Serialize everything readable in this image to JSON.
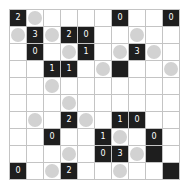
{
  "puzzle": {
    "type": "Light Up",
    "rows": 10,
    "cols": 10,
    "colors": {
      "black_cell": "#1e1e1e",
      "white_cell": "#ffffff",
      "lamp": "#d2d2d2",
      "grid_line": "#c4c4c4",
      "number": "#ffffff"
    },
    "grid": [
      [
        "2",
        "L",
        ".",
        ".",
        ".",
        ".",
        "0",
        ".",
        ".",
        "0"
      ],
      [
        "L",
        "3",
        "L",
        "2",
        "0",
        ".",
        ".",
        "L",
        ".",
        "."
      ],
      [
        ".",
        "0",
        ".",
        "L",
        "1",
        ".",
        "L",
        "3",
        "L",
        "."
      ],
      [
        ".",
        ".",
        "1",
        "1",
        ".",
        "L",
        "B",
        ".",
        ".",
        "L"
      ],
      [
        ".",
        ".",
        "L",
        ".",
        ".",
        ".",
        ".",
        ".",
        ".",
        "."
      ],
      [
        ".",
        ".",
        ".",
        "L",
        ".",
        ".",
        ".",
        ".",
        ".",
        "."
      ],
      [
        ".",
        "L",
        ".",
        "2",
        "L",
        ".",
        "1",
        "0",
        ".",
        "."
      ],
      [
        ".",
        ".",
        "0",
        ".",
        ".",
        "1",
        "L",
        ".",
        "0",
        "."
      ],
      [
        ".",
        ".",
        ".",
        "L",
        ".",
        "0",
        "3",
        "L",
        "B",
        "."
      ],
      [
        "0",
        ".",
        "L",
        "2",
        ".",
        ".",
        "L",
        ".",
        ".",
        "B"
      ]
    ],
    "legend": {
      "digit": "black cell with clue number",
      "B": "black cell without number",
      "L": "lamp (light bulb) on white cell",
      ".": "empty white cell"
    }
  }
}
